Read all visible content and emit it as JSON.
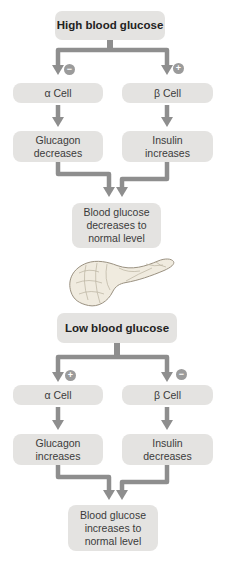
{
  "diagram": {
    "type": "flowchart",
    "colors": {
      "page_bg": "#ffffff",
      "box_bg": "#e4e3e1",
      "box_text": "#3b3b3b",
      "header_text": "#222222",
      "arrow": "#8e8e8e",
      "badge_bg": "#9b9b9b",
      "badge_symbol": "#ffffff",
      "pancreas_fill": "#f0ebdf",
      "pancreas_stroke": "#9a9181",
      "pancreas_texture": "#b9b19f"
    },
    "high": {
      "header": "High blood glucose",
      "alpha_signal": "−",
      "beta_signal": "+",
      "alpha_cell": "α Cell",
      "beta_cell": "β Cell",
      "alpha_effect": "Glucagon\ndecreases",
      "beta_effect": "Insulin\nincreases",
      "outcome": "Blood glucose\ndecreases to\nnormal level"
    },
    "low": {
      "header": "Low blood glucose",
      "alpha_signal": "+",
      "beta_signal": "−",
      "alpha_cell": "α Cell",
      "beta_cell": "β Cell",
      "alpha_effect": "Glucagon\nincreases",
      "beta_effect": "Insulin\ndecreases",
      "outcome": "Blood glucose\nincreases to\nnormal level"
    },
    "illustration": "pancreas"
  }
}
